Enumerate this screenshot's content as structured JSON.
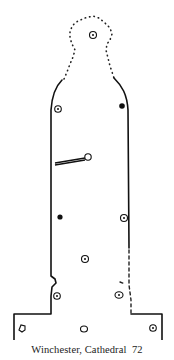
{
  "figure": {
    "caption": "Winchester, Cathedral  72",
    "colors": {
      "line": "#111111",
      "background": "#ffffff"
    },
    "holes": [
      {
        "id": "head-hole",
        "x": 93,
        "y": 35,
        "type": "ring"
      },
      {
        "id": "upper-left-hole",
        "x": 58,
        "y": 109,
        "type": "ring"
      },
      {
        "id": "upper-right-hole",
        "x": 122,
        "y": 106,
        "type": "filled"
      },
      {
        "id": "strap-pin-hole",
        "x": 88,
        "y": 157,
        "type": "open"
      },
      {
        "id": "mid-left-hole",
        "x": 60,
        "y": 217,
        "type": "filled"
      },
      {
        "id": "mid-right-hole",
        "x": 124,
        "y": 218,
        "type": "ring"
      },
      {
        "id": "lower-center-hole",
        "x": 85,
        "y": 259,
        "type": "ring"
      },
      {
        "id": "lower-left-hole",
        "x": 57,
        "y": 296,
        "type": "ring"
      },
      {
        "id": "lower-right-hole",
        "x": 119,
        "y": 295,
        "type": "ring"
      },
      {
        "id": "base-left-hole",
        "x": 22,
        "y": 328,
        "type": "open"
      },
      {
        "id": "base-center-hole",
        "x": 84,
        "y": 329,
        "type": "open"
      },
      {
        "id": "base-right-hole",
        "x": 153,
        "y": 328,
        "type": "ring"
      }
    ]
  }
}
